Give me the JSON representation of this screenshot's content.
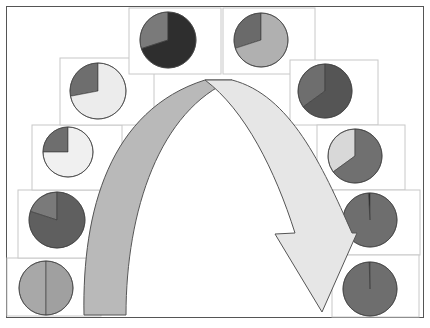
{
  "figure": {
    "caption": "",
    "colors": {
      "frame_border": "#555555",
      "box_border": "#c8c8c8",
      "arrow_rising_fill": "#b9b9b9",
      "arrow_falling_fill": "#e6e6e6",
      "arrow_stroke": "#555555",
      "slice_dark": "#2e2e2e",
      "slice_mid_dark": "#5a5a5a",
      "slice_mid": "#737373",
      "slice_gray": "#8c8c8c",
      "slice_light": "#b0b0b0",
      "slice_very_light": "#eeeeee"
    }
  },
  "chart_data": {
    "type": "pie",
    "title": "",
    "panels": [
      {
        "id": "left-1-bottom",
        "position": "left column, bottom",
        "slices": [
          {
            "label": "A",
            "value": 50,
            "color": "#a8a8a8"
          },
          {
            "label": "B",
            "value": 50,
            "color": "#a0a0a0"
          }
        ]
      },
      {
        "id": "left-2",
        "position": "left column, second from bottom",
        "slices": [
          {
            "label": "A",
            "value": 20,
            "color": "#7a7a7a"
          },
          {
            "label": "B",
            "value": 80,
            "color": "#5f5f5f"
          }
        ]
      },
      {
        "id": "left-3",
        "position": "left column, middle",
        "slices": [
          {
            "label": "A",
            "value": 25,
            "color": "#6e6e6e"
          },
          {
            "label": "B",
            "value": 75,
            "color": "#f0f0f0"
          }
        ]
      },
      {
        "id": "left-4",
        "position": "left column, upper",
        "slices": [
          {
            "label": "A",
            "value": 28,
            "color": "#6e6e6e"
          },
          {
            "label": "B",
            "value": 72,
            "color": "#ececec"
          }
        ]
      },
      {
        "id": "top-left",
        "position": "top row, left",
        "slices": [
          {
            "label": "A",
            "value": 30,
            "color": "#7a7a7a"
          },
          {
            "label": "B",
            "value": 70,
            "color": "#2e2e2e"
          }
        ]
      },
      {
        "id": "top-right",
        "position": "top row, right",
        "slices": [
          {
            "label": "A",
            "value": 30,
            "color": "#6a6a6a"
          },
          {
            "label": "B",
            "value": 70,
            "color": "#b0b0b0"
          }
        ]
      },
      {
        "id": "right-4",
        "position": "right column, upper",
        "slices": [
          {
            "label": "A",
            "value": 35,
            "color": "#6e6e6e"
          },
          {
            "label": "B",
            "value": 65,
            "color": "#555555"
          }
        ]
      },
      {
        "id": "right-3",
        "position": "right column, middle",
        "slices": [
          {
            "label": "A",
            "value": 35,
            "color": "#d8d8d8"
          },
          {
            "label": "B",
            "value": 65,
            "color": "#707070"
          }
        ]
      },
      {
        "id": "right-2",
        "position": "right column, second from bottom",
        "slices": [
          {
            "label": "A",
            "value": 1,
            "color": "#222222"
          },
          {
            "label": "B",
            "value": 99,
            "color": "#6e6e6e"
          }
        ]
      },
      {
        "id": "right-1-bottom",
        "position": "right column, bottom",
        "slices": [
          {
            "label": "A",
            "value": 0.5,
            "color": "#6a6a6a"
          },
          {
            "label": "B",
            "value": 99.5,
            "color": "#6e6e6e"
          }
        ]
      }
    ],
    "annotations": [
      "curved arrow rising on left (gray)",
      "curved arrow descending on right (light gray) ending in arrowhead"
    ]
  }
}
